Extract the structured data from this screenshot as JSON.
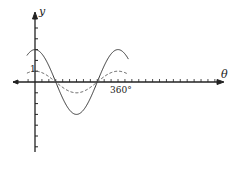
{
  "chart_data": {
    "type": "line",
    "title": "",
    "xlabel": "θ",
    "ylabel": "y",
    "x_unit": "degrees",
    "xlim": [
      -45,
      410
    ],
    "ylim": [
      -6,
      6.5
    ],
    "grid": false,
    "legend": null,
    "annotations": [
      {
        "text": "1",
        "at": {
          "x": 0,
          "y": 1
        }
      },
      {
        "text": "360°",
        "at": {
          "x": 360,
          "y": 0
        }
      }
    ],
    "x_tick_labels": [
      "360°"
    ],
    "y_tick_labels": [
      "1"
    ],
    "series": [
      {
        "name": "y = 3cos θ",
        "style": "solid",
        "color": "#333333",
        "amplitude": 3,
        "period_deg": 360,
        "x": [
          -45,
          0,
          45,
          90,
          135,
          180,
          225,
          270,
          315,
          360,
          405
        ],
        "values": [
          2.12,
          3,
          2.12,
          0,
          -2.12,
          -3,
          -2.12,
          0,
          2.12,
          3,
          2.12
        ]
      },
      {
        "name": "y = cos θ",
        "style": "dashed",
        "color": "#555555",
        "amplitude": 1,
        "period_deg": 360,
        "x": [
          -45,
          0,
          45,
          90,
          135,
          180,
          225,
          270,
          315,
          360,
          405
        ],
        "values": [
          0.71,
          1,
          0.71,
          0,
          -0.71,
          -1,
          -0.71,
          0,
          0.71,
          1,
          0.71
        ]
      }
    ]
  },
  "labels": {
    "y_axis": "y",
    "x_axis": "θ",
    "one": "1",
    "three_sixty": "360°"
  },
  "layout": {
    "origin_px": [
      35,
      82
    ],
    "px_per_deg": 0.2306,
    "px_per_unit": 10.8,
    "y_axis_top": 12,
    "y_axis_bottom": 152,
    "x_axis_left": 13,
    "x_axis_right": 224,
    "y_ticks_up": 6,
    "y_ticks_down": 6,
    "x_tick_step_deg": 30
  }
}
